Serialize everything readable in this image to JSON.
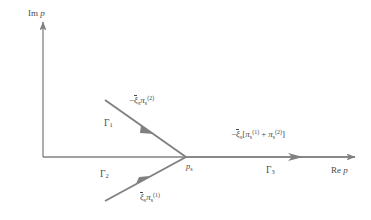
{
  "figure": {
    "background_color": "#ffffff",
    "line_color": "#808080",
    "text_color": "#4a4a4a",
    "width": 371,
    "height": 220
  },
  "axes": {
    "imaginary": {
      "label": "Im p",
      "label_prefix": "Im ",
      "label_variable": "p",
      "direction": "up",
      "origin": {
        "x": 43,
        "y": 157
      },
      "tip": {
        "x": 43,
        "y": 18
      }
    },
    "real": {
      "label": "Re p",
      "label_prefix": "Re ",
      "label_variable": "p",
      "direction": "right",
      "origin": {
        "x": 43,
        "y": 157
      },
      "tip": {
        "x": 360,
        "y": 157
      }
    }
  },
  "saddle_point": {
    "label": "p",
    "subscript": "s",
    "x": 186,
    "y": 157
  },
  "contours": [
    {
      "id": "gamma-1",
      "name": "Γ",
      "subscript": "1",
      "direction": "incoming",
      "from": {
        "x": 105,
        "y": 100
      },
      "to": {
        "x": 186,
        "y": 157
      },
      "arrow_at": {
        "x": 150,
        "y": 131
      },
      "phase_label": {
        "sign": "−",
        "amplitude": "ξ",
        "amplitude_sub": "s",
        "amplitude_bar": true,
        "term": "π",
        "term_sub": "s",
        "term_sup": "(2)"
      }
    },
    {
      "id": "gamma-2",
      "name": "Γ",
      "subscript": "2",
      "direction": "incoming",
      "from": {
        "x": 105,
        "y": 201
      },
      "to": {
        "x": 186,
        "y": 157
      },
      "arrow_at": {
        "x": 144,
        "y": 180
      },
      "phase_label": {
        "sign": "",
        "amplitude": "ξ",
        "amplitude_sub": "s",
        "amplitude_bar": true,
        "term": "π",
        "term_sub": "s",
        "term_sup": "(1)"
      }
    },
    {
      "id": "gamma-3",
      "name": "Γ",
      "subscript": "3",
      "direction": "outgoing",
      "from": {
        "x": 186,
        "y": 157
      },
      "to": {
        "x": 360,
        "y": 157
      },
      "arrow_at": {
        "x": 300,
        "y": 157
      },
      "phase_label": {
        "sign": "−",
        "amplitude": "ξ",
        "amplitude_sub": "s",
        "amplitude_bar": true,
        "bracket_open": "[",
        "term1": "π",
        "term1_sub": "s",
        "term1_sup": "(1)",
        "operator": "+",
        "term2": "π",
        "term2_sub": "s",
        "term2_sup": "(2)",
        "bracket_close": "]"
      }
    }
  ],
  "labels": {
    "gamma1_name": "Γ",
    "gamma1_sub": "1",
    "gamma2_name": "Γ",
    "gamma2_sub": "2",
    "gamma3_name": "Γ",
    "gamma3_sub": "3",
    "minus": "−",
    "xi": "ξ",
    "pi": "π",
    "sub_s": "s",
    "sup_1": "(1)",
    "sup_2": "(2)",
    "bracket_open": "[",
    "bracket_close": "]",
    "plus": "+",
    "im_prefix": "Im ",
    "re_prefix": "Re ",
    "p_var": "p",
    "saddle_p": "p",
    "saddle_sub": "s"
  }
}
